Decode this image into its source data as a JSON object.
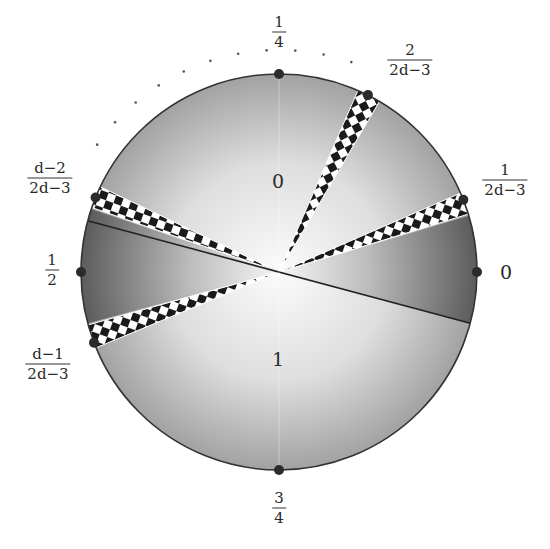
{
  "diagram": {
    "title": "",
    "center": [
      279,
      272
    ],
    "radius": 198,
    "colors": {
      "background": "#ffffff",
      "disk_light": "#f4f4f4",
      "disk_dark": "#8f8f8f",
      "sector_dark": "#5a5a5a",
      "sector_light": "#f2f2f2",
      "checker_dark": "#1a1a1a",
      "checker_light": "#ffffff",
      "outline": "#333333",
      "dot": "#2b2b2b"
    },
    "boundary_points": [
      {
        "id": "p0",
        "angle_deg": 0,
        "label_num": "0",
        "label_den": ""
      },
      {
        "id": "p1",
        "angle_deg": 21.4,
        "label_num": "1",
        "label_den": "2d−3"
      },
      {
        "id": "p2",
        "angle_deg": 63.3,
        "label_num": "2",
        "label_den": "2d−3"
      },
      {
        "id": "p14",
        "angle_deg": 90,
        "label_num": "1",
        "label_den": "4"
      },
      {
        "id": "pd2",
        "angle_deg": 157.9,
        "label_num": "d−2",
        "label_den": "2d−3"
      },
      {
        "id": "p12",
        "angle_deg": 180,
        "label_num": "1",
        "label_den": "2"
      },
      {
        "id": "pd1",
        "angle_deg": 200.9,
        "label_num": "d−1",
        "label_den": "2d−3"
      },
      {
        "id": "p34",
        "angle_deg": 270,
        "label_num": "3",
        "label_den": "4"
      }
    ],
    "region_labels": [
      {
        "id": "region-0",
        "text": "0",
        "x": 278,
        "y": 181
      },
      {
        "id": "region-1",
        "text": "1",
        "x": 278,
        "y": 359
      }
    ],
    "dark_sectors": [
      {
        "id": "right-sector",
        "from_deg": -15,
        "to_deg": 16.5
      },
      {
        "id": "left-sector",
        "from_deg": 161.5,
        "to_deg": 195
      }
    ],
    "checkered_wedges": [
      {
        "id": "wedge-upper-right",
        "from_deg": 17,
        "to_deg": 23.5
      },
      {
        "id": "wedge-top",
        "from_deg": 59.5,
        "to_deg": 66.5
      },
      {
        "id": "wedge-upper-left",
        "from_deg": 154.5,
        "to_deg": 161
      },
      {
        "id": "wedge-lower-left",
        "from_deg": 195.5,
        "to_deg": 202.5
      }
    ],
    "divider_line": {
      "from_deg": 165,
      "to_deg": 345
    },
    "dotted_arc": {
      "radius": 222,
      "from_deg": 71,
      "to_deg": 145,
      "count": 11
    }
  }
}
